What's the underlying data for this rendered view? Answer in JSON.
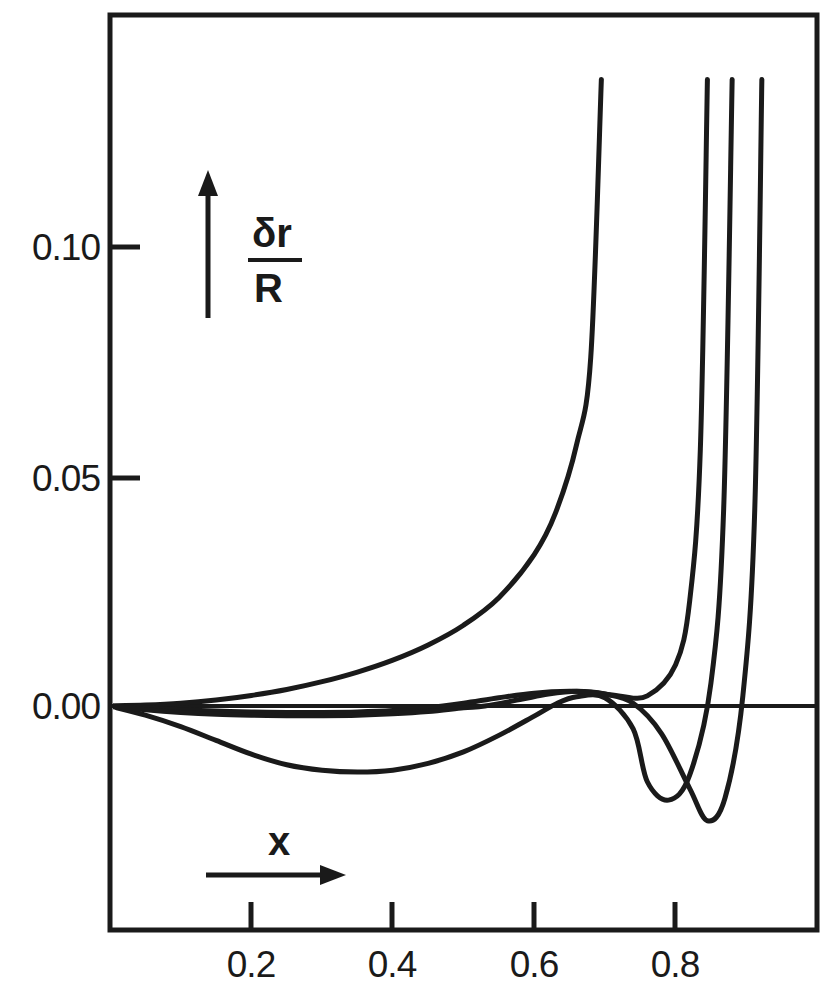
{
  "chart_data": {
    "type": "line",
    "title": "",
    "subtitle": "",
    "xlabel": "x",
    "ylabel": "δr/R",
    "ylabel_numerator": "δr",
    "ylabel_denominator": "R",
    "xlim": [
      0.0,
      1.0
    ],
    "ylim": [
      -0.032,
      0.1365
    ],
    "grid": false,
    "legend": "none",
    "line_color": "#1a1a1a",
    "axis_color": "#1a1a1a",
    "background": "#ffffff",
    "xticks": [
      0.2,
      0.4,
      0.6,
      0.8
    ],
    "xtick_labels": [
      "0.2",
      "0.4",
      "0.6",
      "0.8"
    ],
    "yticks": [
      0.0,
      0.05,
      0.1
    ],
    "ytick_labels": [
      "0.00",
      "0.05",
      "0.10"
    ],
    "annotations": [
      {
        "name": "y-axis-arrow",
        "text": "δr/R",
        "direction": "up"
      },
      {
        "name": "x-axis-arrow",
        "text": "x",
        "direction": "right"
      }
    ],
    "series": [
      {
        "name": "zero-line",
        "note": "horizontal reference line at delta r / R = 0",
        "x": [
          0.0,
          1.0
        ],
        "y": [
          0.0,
          0.0
        ]
      },
      {
        "name": "curve-1",
        "note": "monotonic divergent curve, exits top of frame near x = 0.68",
        "x": [
          0.0,
          0.05,
          0.1,
          0.15,
          0.2,
          0.25,
          0.3,
          0.35,
          0.4,
          0.45,
          0.5,
          0.55,
          0.6,
          0.63,
          0.66,
          0.68,
          0.695
        ],
        "y": [
          0.0,
          0.0002,
          0.0006,
          0.0013,
          0.0023,
          0.0036,
          0.0053,
          0.0074,
          0.01,
          0.0133,
          0.0176,
          0.0236,
          0.033,
          0.042,
          0.057,
          0.076,
          0.1365
        ]
      },
      {
        "name": "curve-2",
        "note": "shallow dip then hump near x = 0.66, then divergent, exits top near x = 0.845",
        "x": [
          0.0,
          0.05,
          0.1,
          0.15,
          0.2,
          0.25,
          0.3,
          0.35,
          0.4,
          0.45,
          0.5,
          0.55,
          0.6,
          0.65,
          0.68,
          0.72,
          0.76,
          0.8,
          0.82,
          0.835,
          0.845
        ],
        "y": [
          0.0,
          -0.0004,
          -0.0008,
          -0.0011,
          -0.0013,
          -0.0014,
          -0.0014,
          -0.0013,
          -0.001,
          -0.0004,
          0.0006,
          0.0018,
          0.0028,
          0.0032,
          0.003,
          0.0022,
          0.0022,
          0.009,
          0.023,
          0.056,
          0.1365
        ]
      },
      {
        "name": "curve-3",
        "note": "broad negative trough at x = 0.35, rises and crosses zero near x = 0.60, deep minimum at x = 0.76, divergent, exits top near x = 0.885",
        "x": [
          0.0,
          0.05,
          0.1,
          0.15,
          0.2,
          0.25,
          0.3,
          0.35,
          0.4,
          0.45,
          0.5,
          0.55,
          0.6,
          0.63,
          0.66,
          0.7,
          0.74,
          0.76,
          0.79,
          0.82,
          0.85,
          0.868,
          0.88
        ],
        "y": [
          0.0,
          -0.002,
          -0.0045,
          -0.0075,
          -0.0105,
          -0.0128,
          -0.014,
          -0.0144,
          -0.014,
          -0.0125,
          -0.01,
          -0.0064,
          -0.0022,
          0.0004,
          0.002,
          0.0018,
          -0.005,
          -0.0165,
          -0.0205,
          -0.015,
          0.005,
          0.043,
          0.1365
        ]
      },
      {
        "name": "curve-4",
        "note": "gentle negative drift, crosses zero near x = 0.53, hump at x = 0.66, deep minimum at x = 0.845, divergent, exits top near x = 0.925",
        "x": [
          0.0,
          0.05,
          0.1,
          0.15,
          0.2,
          0.25,
          0.3,
          0.35,
          0.4,
          0.45,
          0.5,
          0.53,
          0.58,
          0.62,
          0.66,
          0.7,
          0.74,
          0.78,
          0.82,
          0.845,
          0.87,
          0.895,
          0.912,
          0.922
        ],
        "y": [
          0.0,
          -0.0008,
          -0.0014,
          -0.0018,
          -0.002,
          -0.0021,
          -0.0021,
          -0.002,
          -0.0017,
          -0.0012,
          -0.0004,
          0.0,
          0.0014,
          0.0026,
          0.0032,
          0.0026,
          0.0006,
          -0.006,
          -0.018,
          -0.025,
          -0.02,
          0.002,
          0.043,
          0.1365
        ]
      }
    ]
  },
  "axes": {
    "frame": {
      "left_px": 110,
      "right_px": 817,
      "top_px": 15,
      "bottom_px": 930
    },
    "origin": {
      "x_px": 110,
      "y_px": 706
    },
    "x_unit_px": 707,
    "y_unit_px": 4590
  }
}
